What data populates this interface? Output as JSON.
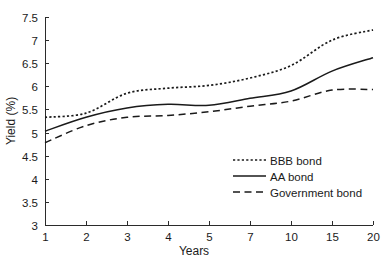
{
  "chart_data": {
    "type": "line",
    "title": "",
    "xlabel": "Years",
    "ylabel": "Yield (%)",
    "x": [
      1,
      2,
      3,
      4,
      5,
      7,
      10,
      15,
      20
    ],
    "xtick_labels": [
      "1",
      "2",
      "3",
      "4",
      "5",
      "7",
      "10",
      "15",
      "20"
    ],
    "ytick_labels": [
      "3",
      "3.5",
      "4",
      "4.5",
      "5",
      "5.5",
      "6",
      "6.5",
      "7",
      "7.5"
    ],
    "ytick_values": [
      3,
      3.5,
      4,
      4.5,
      5,
      5.5,
      6,
      6.5,
      7,
      7.5
    ],
    "ylim": [
      3,
      7.5
    ],
    "xlim_index": [
      0,
      8
    ],
    "x_scale": "ordinal",
    "grid": false,
    "legend_position": "lower right",
    "series": [
      {
        "name": "BBB bond",
        "style": "dotted",
        "color": "#1a1a1a",
        "values": [
          5.33,
          5.42,
          5.85,
          5.96,
          6.02,
          6.18,
          6.45,
          7.0,
          7.22
        ]
      },
      {
        "name": "AA bond",
        "style": "solid",
        "color": "#1a1a1a",
        "values": [
          5.03,
          5.33,
          5.53,
          5.61,
          5.59,
          5.74,
          5.9,
          6.33,
          6.62
        ]
      },
      {
        "name": "Government bond",
        "style": "dashed",
        "color": "#1a1a1a",
        "values": [
          4.78,
          5.15,
          5.33,
          5.37,
          5.45,
          5.57,
          5.68,
          5.92,
          5.93
        ]
      }
    ],
    "legend_entries": [
      {
        "label": "BBB bond",
        "style": "dotted"
      },
      {
        "label": "AA bond",
        "style": "solid"
      },
      {
        "label": "Government bond",
        "style": "dashed"
      }
    ]
  }
}
